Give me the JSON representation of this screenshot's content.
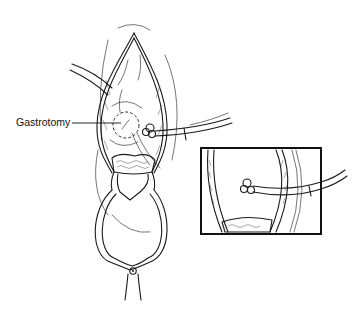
{
  "figure": {
    "labels": [
      {
        "id": "gastrotomy",
        "text": "Gastrotomy"
      }
    ],
    "inset": {
      "present": true,
      "description": "close-up of tube inserted through gastrotomy"
    },
    "colors": {
      "line": "#1a1a1a",
      "background": "#ffffff"
    }
  }
}
